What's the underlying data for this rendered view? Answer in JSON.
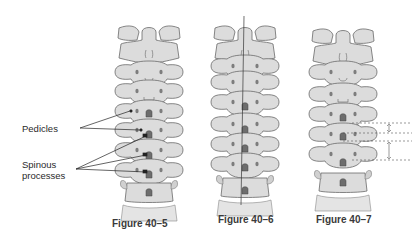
{
  "figures": [
    {
      "id": "fig-40-5",
      "caption": "Figure 40–5",
      "labels": {
        "pedicles": "Pedicles",
        "spinous_line1": "Spinous",
        "spinous_line2": "processes"
      }
    },
    {
      "id": "fig-40-6",
      "caption": "Figure 40–6"
    },
    {
      "id": "fig-40-7",
      "caption": "Figure 40–7"
    }
  ],
  "colors": {
    "bone_fill": "#dcdcdc",
    "bone_stroke": "#6a6a6a",
    "spinous_fill": "#7d7d7d",
    "text": "#2a2a2a"
  }
}
